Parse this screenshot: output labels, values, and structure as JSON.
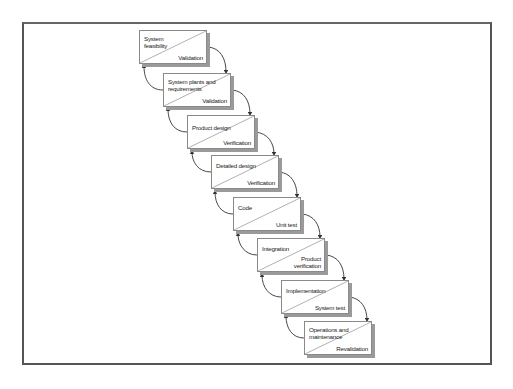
{
  "diagram": {
    "type": "waterfall-lifecycle",
    "stages": [
      {
        "phase": "System feasibility",
        "check": "Validation"
      },
      {
        "phase": "System plants and requirements",
        "check": "Validation"
      },
      {
        "phase": "Product design",
        "check": "Verification"
      },
      {
        "phase": "Detailed design",
        "check": "Verification"
      },
      {
        "phase": "Code",
        "check": "Unit test"
      },
      {
        "phase": "Integration",
        "check": "Product verification"
      },
      {
        "phase": "Implementation",
        "check": "System test"
      },
      {
        "phase": "Operations and maintenance",
        "check": "Revalidation"
      }
    ],
    "colors": {
      "frame": "#555555",
      "box_border": "#8a8a8a",
      "box_shadow": "#9a9a9a",
      "arrow": "#333333",
      "text": "#222222"
    }
  }
}
